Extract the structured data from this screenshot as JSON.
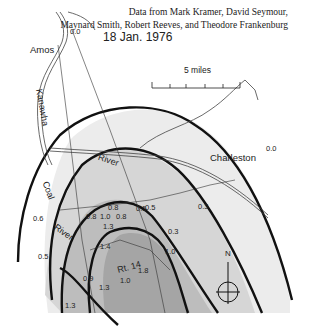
{
  "credit": {
    "line1": "Data from Mark Kramer, David Seymour,",
    "line2": "Maynard Smith, Robert Reeves, and Theodore Frankenburg"
  },
  "date": "18 Jan. 1976",
  "scale": {
    "label": "5 miles",
    "ticks": 5
  },
  "places": {
    "amos": "Amos",
    "charleston": "Charleston"
  },
  "rivers": {
    "kanawha": "Kanawha",
    "coal": "Coal",
    "river1": "River",
    "river2": "River"
  },
  "route": "Rt. 14",
  "north_label": "N",
  "contour_values": {
    "amos_top": "0.0",
    "charleston": "0.0",
    "v1": "0.8",
    "v2": "0.8",
    "v3": "1.0",
    "v4": "0.8",
    "v5": "0.5",
    "v6": "0.5",
    "v7": "1.3",
    "v8": "0.3",
    "v9": "0.3",
    "v10": "1.0",
    "v11": "1.4",
    "v12": "1.8",
    "v13": "1.0",
    "v14": "0.6",
    "v15": "0.5",
    "v16": "0.9",
    "v17": "1.3",
    "v18": "1.3"
  },
  "colors": {
    "zone1": "#ececec",
    "zone2": "#d6d6d6",
    "zone3": "#bdbdbd",
    "zone4": "#a5a5a5",
    "contour": "#111111"
  }
}
